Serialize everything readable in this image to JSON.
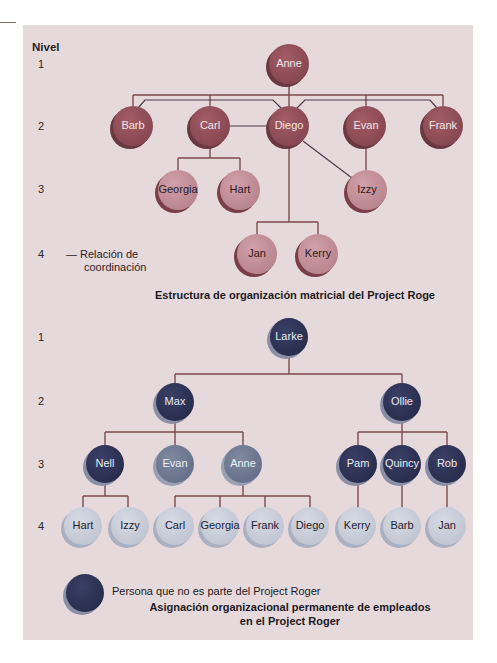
{
  "colors": {
    "panel_bg": "#e6d9dc",
    "line": "#7a4a4e",
    "coord_line": "#4a3a48",
    "matrix_node_dark": "#8e4d55",
    "matrix_node_light": "#c28d95",
    "navy_node": "#2f3457",
    "gray_node": "#707a91",
    "pale_node": "#c8ccd8"
  },
  "levels_header": "Nivel",
  "top_chart": {
    "levels": [
      "1",
      "2",
      "3",
      "4"
    ],
    "legend": {
      "line_glyph": "—",
      "label_line1": "Relación de",
      "label_line2": "coordinación"
    },
    "caption": "Estructura de organización matricial del Project Roge",
    "nodes": [
      {
        "id": "anne",
        "label": "Anne",
        "x": 289,
        "y": 64,
        "style": "dark"
      },
      {
        "id": "barb",
        "label": "Barb",
        "x": 133,
        "y": 126,
        "style": "dark"
      },
      {
        "id": "carl",
        "label": "Carl",
        "x": 210,
        "y": 126,
        "style": "dark"
      },
      {
        "id": "diego",
        "label": "Diego",
        "x": 289,
        "y": 126,
        "style": "dark"
      },
      {
        "id": "evan",
        "label": "Evan",
        "x": 366,
        "y": 126,
        "style": "dark"
      },
      {
        "id": "frank",
        "label": "Frank",
        "x": 443,
        "y": 126,
        "style": "dark"
      },
      {
        "id": "georgia",
        "label": "Georgia",
        "x": 178,
        "y": 190,
        "style": "light"
      },
      {
        "id": "hart",
        "label": "Hart",
        "x": 240,
        "y": 190,
        "style": "light"
      },
      {
        "id": "izzy",
        "label": "Izzy",
        "x": 367,
        "y": 190,
        "style": "light"
      },
      {
        "id": "jan",
        "label": "Jan",
        "x": 257,
        "y": 254,
        "style": "light"
      },
      {
        "id": "kerry",
        "label": "Kerry",
        "x": 318,
        "y": 254,
        "style": "light"
      }
    ]
  },
  "bottom_chart": {
    "levels": [
      "1",
      "2",
      "3",
      "4"
    ],
    "legend_text": "Persona que no es parte del Project Roger",
    "caption_line1": "Asignación organizacional permanente de empleados",
    "caption_line2": "en el Project Roger",
    "nodes": [
      {
        "id": "larke",
        "label": "Larke",
        "x": 289,
        "y": 337,
        "style": "navy"
      },
      {
        "id": "max",
        "label": "Max",
        "x": 175,
        "y": 402,
        "style": "navy"
      },
      {
        "id": "ollie",
        "label": "Ollie",
        "x": 402,
        "y": 402,
        "style": "navy"
      },
      {
        "id": "nell",
        "label": "Nell",
        "x": 105,
        "y": 464,
        "style": "navy"
      },
      {
        "id": "evan2",
        "label": "Evan",
        "x": 175,
        "y": 464,
        "style": "gray"
      },
      {
        "id": "anne2",
        "label": "Anne",
        "x": 243,
        "y": 464,
        "style": "gray"
      },
      {
        "id": "pam",
        "label": "Pam",
        "x": 358,
        "y": 464,
        "style": "navy"
      },
      {
        "id": "quincy",
        "label": "Quincy",
        "x": 402,
        "y": 464,
        "style": "navy"
      },
      {
        "id": "rob",
        "label": "Rob",
        "x": 447,
        "y": 464,
        "style": "navy"
      },
      {
        "id": "hart2",
        "label": "Hart",
        "x": 83,
        "y": 526,
        "style": "pale"
      },
      {
        "id": "izzy2",
        "label": "Izzy",
        "x": 130,
        "y": 526,
        "style": "pale"
      },
      {
        "id": "carl2",
        "label": "Carl",
        "x": 175,
        "y": 526,
        "style": "pale"
      },
      {
        "id": "georgia2",
        "label": "Georgia",
        "x": 220,
        "y": 526,
        "style": "pale"
      },
      {
        "id": "frank2",
        "label": "Frank",
        "x": 265,
        "y": 526,
        "style": "pale"
      },
      {
        "id": "diego2",
        "label": "Diego",
        "x": 310,
        "y": 526,
        "style": "pale"
      },
      {
        "id": "kerry2",
        "label": "Kerry",
        "x": 357,
        "y": 526,
        "style": "pale"
      },
      {
        "id": "barb2",
        "label": "Barb",
        "x": 402,
        "y": 526,
        "style": "pale"
      },
      {
        "id": "jan2",
        "label": "Jan",
        "x": 447,
        "y": 526,
        "style": "pale"
      }
    ]
  }
}
